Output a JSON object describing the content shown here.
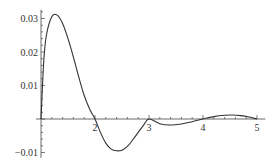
{
  "chart_data": {
    "type": "line",
    "title": "",
    "xlabel": "",
    "ylabel": "",
    "xlim": [
      0.9,
      5.1
    ],
    "ylim": [
      -0.011,
      0.032
    ],
    "grid": false,
    "legend": null,
    "x_ticks": [
      2,
      3,
      4,
      5
    ],
    "x_tick_labels": [
      "2",
      "3",
      "4",
      "5"
    ],
    "y_ticks": [
      -0.01,
      0.01,
      0.02,
      0.03
    ],
    "y_tick_labels": [
      "-0.01",
      "0.01",
      "0.02",
      "0.03"
    ],
    "axes_origin": {
      "x": 1,
      "y": 0
    },
    "series": [
      {
        "name": "f(x)",
        "color": "#333333",
        "x": [
          1.0,
          1.05,
          1.1,
          1.2,
          1.3,
          1.4,
          1.5,
          1.6,
          1.7,
          1.8,
          1.9,
          2.0,
          2.1,
          2.2,
          2.3,
          2.4,
          2.5,
          2.6,
          2.7,
          2.8,
          2.9,
          3.0,
          3.2,
          3.4,
          3.6,
          3.8,
          4.0,
          4.2,
          4.4,
          4.55,
          4.7,
          4.85,
          5.0
        ],
        "y": [
          0.0,
          0.017,
          0.025,
          0.0305,
          0.031,
          0.0285,
          0.024,
          0.0185,
          0.0125,
          0.007,
          0.003,
          0.0,
          -0.004,
          -0.0072,
          -0.009,
          -0.0095,
          -0.0093,
          -0.0082,
          -0.0062,
          -0.004,
          -0.0018,
          0.0,
          -0.0014,
          -0.0018,
          -0.0015,
          -0.0008,
          0.0,
          0.0007,
          0.0011,
          0.0012,
          0.001,
          0.0006,
          0.0
        ]
      }
    ]
  }
}
